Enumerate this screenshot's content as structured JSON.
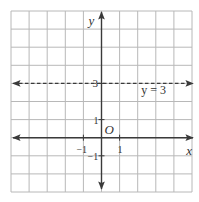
{
  "chart_data": {
    "type": "line",
    "title": "",
    "xlabel": "x",
    "ylabel": "y",
    "origin_label": "O",
    "grid": true,
    "xlim": [
      -5,
      5
    ],
    "ylim": [
      -3,
      7
    ],
    "x_ticks": [
      {
        "value": -1,
        "label": "−1"
      },
      {
        "value": 1,
        "label": "1"
      }
    ],
    "y_ticks": [
      {
        "value": -1,
        "label": "−1"
      },
      {
        "value": 1,
        "label": "1"
      },
      {
        "value": 3,
        "label": "3"
      }
    ],
    "series": [
      {
        "name": "y = 3",
        "equation": "y = 3",
        "style": "dashed",
        "x": [
          -5,
          5
        ],
        "y": [
          3,
          3
        ]
      }
    ],
    "annotations": [
      {
        "text": "y = 3",
        "x": 2.3,
        "y": 2.6
      }
    ]
  },
  "colors": {
    "grid": "#b8b8b8",
    "axis": "#3a3a3a",
    "line": "#3a3a3a",
    "text": "#333333"
  }
}
